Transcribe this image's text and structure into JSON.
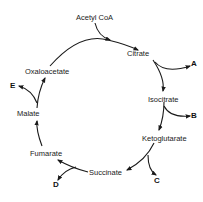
{
  "diagram": {
    "input": {
      "label": "Acetyl CoA"
    },
    "intermediates": [
      {
        "id": "citrate",
        "label": "Citrate"
      },
      {
        "id": "isocitrate",
        "label": "Isocitrate"
      },
      {
        "id": "ketoglutarate",
        "label": "Ketoglutarate"
      },
      {
        "id": "succinate",
        "label": "Succinate"
      },
      {
        "id": "fumarate",
        "label": "Fumarate"
      },
      {
        "id": "malate",
        "label": "Malate"
      },
      {
        "id": "oxaloacetate",
        "label": "Oxaloacetate"
      }
    ],
    "outputs": [
      {
        "id": "A",
        "label": "A",
        "from": "Citrate"
      },
      {
        "id": "B",
        "label": "B",
        "from": "Isocitrate"
      },
      {
        "id": "C",
        "label": "C",
        "from": "Ketoglutarate"
      },
      {
        "id": "D",
        "label": "D",
        "from": "Succinate"
      },
      {
        "id": "E",
        "label": "E",
        "from": "Malate"
      }
    ],
    "colors": {
      "line": "#1a1a1a",
      "background": "#ffffff"
    }
  }
}
